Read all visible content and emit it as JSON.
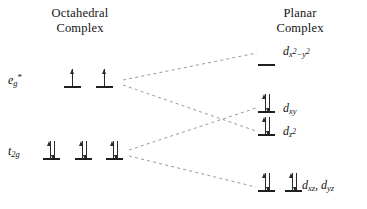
{
  "diagram": {
    "kind": "crystal-field-splitting-diagram",
    "width": 367,
    "height": 209,
    "background_color": "#ffffff",
    "line_color": "#1f1f1f",
    "dash_color": "#9a9a9a"
  },
  "columns": {
    "left": {
      "title": "Octahedral\nComplex"
    },
    "right": {
      "title": "Planar\nComplex"
    }
  },
  "left_levels": [
    {
      "id": "eg-star",
      "term_html": "e<sub>g</sub><sup>*</sup>",
      "term_text": "eg*",
      "orbitals": [
        {
          "electrons": "up",
          "spin_labels": [
            "up"
          ]
        },
        {
          "electrons": "up",
          "spin_labels": [
            "up"
          ]
        }
      ]
    },
    {
      "id": "t2g",
      "term_html": "t<sub>2g</sub>",
      "term_text": "t2g",
      "orbitals": [
        {
          "electrons": "pair",
          "spin_labels": [
            "up",
            "down"
          ]
        },
        {
          "electrons": "pair",
          "spin_labels": [
            "up",
            "down"
          ]
        },
        {
          "electrons": "pair",
          "spin_labels": [
            "up",
            "down"
          ]
        }
      ]
    }
  ],
  "right_levels": [
    {
      "id": "dx2-y2",
      "label_html": "d<span class=\"subsup\">x<sup>2</sup>&minus;y<sup>2</sup></span>",
      "label_text": "dx2-y2",
      "orbitals": [
        {
          "electrons": "empty",
          "spin_labels": []
        }
      ]
    },
    {
      "id": "dxy",
      "label_html": "d<sub>xy</sub>",
      "label_text": "dxy",
      "orbitals": [
        {
          "electrons": "pair",
          "spin_labels": [
            "up",
            "down"
          ]
        }
      ]
    },
    {
      "id": "dz2",
      "label_html": "d<span class=\"subsup\">z<sup>2</sup></span>",
      "label_text": "dz2",
      "orbitals": [
        {
          "electrons": "pair",
          "spin_labels": [
            "up",
            "down"
          ]
        }
      ]
    },
    {
      "id": "dxz-dyz",
      "label_html": "d<sub>xz</sub>, d<sub>yz</sub>",
      "label_text": "dxz, dyz",
      "orbitals": [
        {
          "electrons": "pair",
          "spin_labels": [
            "up",
            "down"
          ]
        },
        {
          "electrons": "pair",
          "spin_labels": [
            "up",
            "down"
          ]
        }
      ]
    }
  ],
  "connectors": [
    {
      "from": "eg-star",
      "to": "dx2-y2",
      "style": "dashed"
    },
    {
      "from": "eg-star",
      "to": "dz2",
      "style": "dashed"
    },
    {
      "from": "t2g",
      "to": "dxy",
      "style": "dashed"
    },
    {
      "from": "t2g",
      "to": "dxz-dyz",
      "style": "dashed"
    }
  ]
}
